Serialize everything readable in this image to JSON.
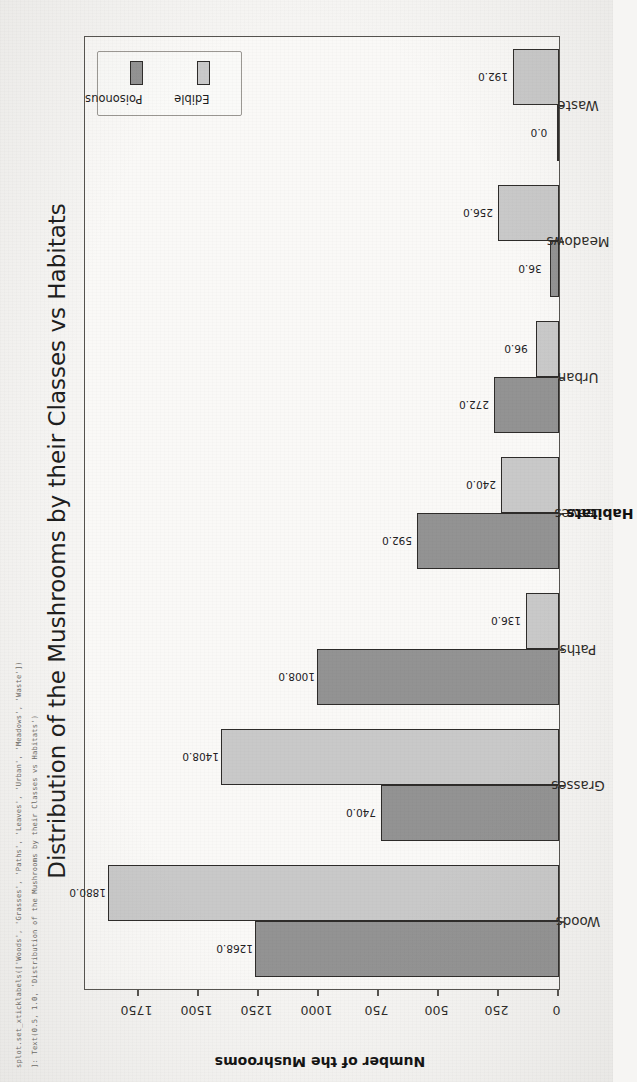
{
  "code_overlay": {
    "line1": "splot.set_xticklabels(['Woods', 'Grasses', 'Paths', 'Leaves', 'Urban', 'Meadows', 'Waste'])",
    "line2": "]: Text(0.5, 1.0, 'Distribution of the Mushrooms by their Classes vs Habitats')"
  },
  "colors": {
    "poisonous": "#939393",
    "edible": "#c9c9c9",
    "axis": "#55534f",
    "background": "#f6f5f3"
  },
  "chart_data": {
    "type": "bar",
    "title": "Distribution of the Mushrooms by their Classes vs Habitats",
    "xlabel": "Habitats",
    "ylabel": "Number of the Mushrooms",
    "categories": [
      "Woods",
      "Grasses",
      "Paths",
      "Leaves",
      "Urban",
      "Meadows",
      "Waste"
    ],
    "series": [
      {
        "name": "Poisonous",
        "color": "#939393",
        "values": [
          1268.0,
          740.0,
          1008.0,
          592.0,
          272.0,
          36.0,
          0.0
        ],
        "labels": [
          "1268.0",
          "740.0",
          "1008.0",
          "592.0",
          "272.0",
          "36.0",
          "0.0"
        ]
      },
      {
        "name": "Edible",
        "color": "#c9c9c9",
        "values": [
          1880.0,
          1408.0,
          136.0,
          240.0,
          96.0,
          256.0,
          192.0
        ],
        "labels": [
          "1880.0",
          "1408.0",
          "136.0",
          "240.0",
          "96.0",
          "256.0",
          "192.0"
        ]
      }
    ],
    "yticks": [
      0,
      250,
      500,
      750,
      1000,
      1250,
      1500,
      1750
    ],
    "ytick_labels": [
      "0",
      "250",
      "500",
      "750",
      "1000",
      "1250",
      "1500",
      "1750"
    ],
    "ylim": [
      0,
      1975
    ],
    "grid": false,
    "legend_position": "upper right",
    "legend_entries": [
      "Poisonous",
      "Edible"
    ]
  }
}
